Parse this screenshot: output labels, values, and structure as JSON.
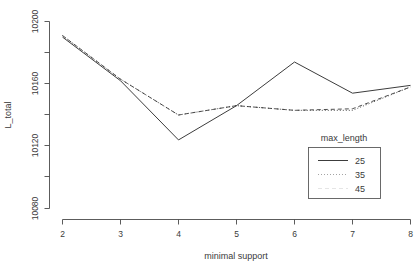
{
  "chart_data": {
    "type": "line",
    "title": "",
    "xlabel": "minimal support",
    "ylabel": "L_total",
    "x": [
      2,
      3,
      4,
      5,
      6,
      7,
      8
    ],
    "xticks": [
      "2",
      "3",
      "4",
      "5",
      "6",
      "7",
      "8"
    ],
    "yticks": [
      "10200",
      "10160",
      "10120",
      "10080"
    ],
    "ytickvalues": [
      10200,
      10160,
      10120,
      10080
    ],
    "xlim": [
      2,
      8
    ],
    "ylim": [
      10080,
      10213
    ],
    "grid": false,
    "legend_position": "bottom-right",
    "legend_title": "max_length",
    "series": [
      {
        "name": "25",
        "linestyle": "solid",
        "color": "#3c3c3c",
        "values": [
          10190,
          10162,
          10124,
          10146,
          10174,
          10154,
          10159
        ]
      },
      {
        "name": "35",
        "linestyle": "dotted",
        "color": "#6a6a6a",
        "values": [
          10191,
          10163,
          10140,
          10146,
          10143,
          10143,
          10158
        ]
      },
      {
        "name": "45",
        "linestyle": "dashed",
        "color": "#8f8f8f",
        "values": [
          10191,
          10163,
          10140,
          10146,
          10143,
          10144,
          10158
        ]
      }
    ]
  },
  "axes": {
    "y_title": "L_total",
    "x_title": "minimal support",
    "y_tick_0": "10200",
    "y_tick_1": "10160",
    "y_tick_2": "10120",
    "y_tick_3": "10080",
    "x_tick_0": "2",
    "x_tick_1": "3",
    "x_tick_2": "4",
    "x_tick_3": "5",
    "x_tick_4": "6",
    "x_tick_5": "7",
    "x_tick_6": "8"
  },
  "legend": {
    "title": "max_length",
    "entries": [
      {
        "label": "25",
        "style": "solid"
      },
      {
        "label": "35",
        "style": "dotted"
      },
      {
        "label": "45",
        "style": "dashed"
      }
    ]
  },
  "colors": {
    "background": "#ffffff",
    "axis": "#4a4a4a",
    "series_25": "#3c3c3c",
    "series_35": "#6a6a6a",
    "series_45": "#8f8f8f"
  }
}
